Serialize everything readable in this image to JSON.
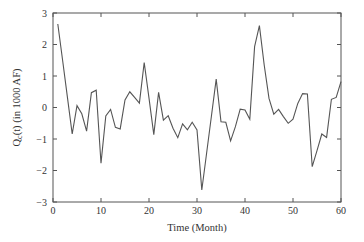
{
  "chart_data": {
    "type": "line",
    "title": "",
    "xlabel": "Time (Month)",
    "ylabel": "Q_c(t)  (in 1000 AF)",
    "ylabel_main": "Q",
    "ylabel_sub": "c",
    "ylabel_rest": "(t)  (in 1000 AF)",
    "xlim": [
      0,
      60
    ],
    "ylim": [
      -3,
      3
    ],
    "xticks": [
      0,
      10,
      20,
      30,
      40,
      50,
      60
    ],
    "yticks": [
      -3,
      -2,
      -1,
      0,
      1,
      2,
      3
    ],
    "grid": false,
    "legend": null,
    "line_color": "#555555",
    "series": [
      {
        "name": "Q_c(t)",
        "x": [
          1,
          2,
          3,
          4,
          5,
          6,
          7,
          8,
          9,
          10,
          11,
          12,
          13,
          14,
          15,
          16,
          17,
          18,
          19,
          20,
          21,
          22,
          23,
          24,
          25,
          26,
          27,
          28,
          29,
          30,
          31,
          32,
          33,
          34,
          35,
          36,
          37,
          38,
          39,
          40,
          41,
          42,
          43,
          44,
          45,
          46,
          47,
          48,
          49,
          50,
          51,
          52,
          53,
          54,
          55,
          56,
          57,
          58,
          59,
          60
        ],
        "values": [
          2.65,
          1.5,
          0.33,
          -0.84,
          0.06,
          -0.2,
          -0.75,
          0.47,
          0.55,
          -1.77,
          -0.27,
          -0.06,
          -0.63,
          -0.68,
          0.24,
          0.5,
          0.32,
          0.14,
          1.43,
          0.3,
          -0.86,
          0.48,
          -0.4,
          -0.26,
          -0.66,
          -0.96,
          -0.52,
          -0.71,
          -0.47,
          -0.71,
          -2.62,
          -1.45,
          -0.28,
          0.9,
          -0.45,
          -0.47,
          -1.06,
          -0.61,
          -0.05,
          -0.08,
          -0.37,
          1.93,
          2.6,
          1.35,
          0.29,
          -0.21,
          -0.06,
          -0.29,
          -0.5,
          -0.37,
          0.13,
          0.44,
          0.43,
          -1.88,
          -1.37,
          -0.84,
          -0.95,
          0.26,
          0.32,
          0.82
        ]
      }
    ]
  }
}
